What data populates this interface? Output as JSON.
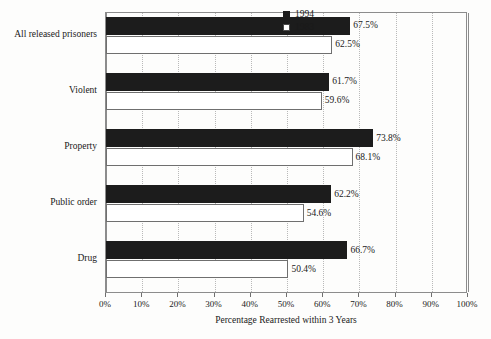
{
  "chart_data": {
    "type": "bar",
    "orientation": "horizontal",
    "title": "",
    "xlabel": "Percentage Rearrested within 3 Years",
    "ylabel": "",
    "xlim": [
      0,
      100
    ],
    "xticks": [
      "0%",
      "10%",
      "20%",
      "30%",
      "40%",
      "50%",
      "60%",
      "70%",
      "80%",
      "90%",
      "100%"
    ],
    "xtick_values": [
      0,
      10,
      20,
      30,
      40,
      50,
      60,
      70,
      80,
      90,
      100
    ],
    "grid": "vertical-dotted",
    "legend_position": "top-right",
    "categories": [
      "All released prisoners",
      "Violent",
      "Property",
      "Public order",
      "Drug"
    ],
    "series": [
      {
        "name": "1994",
        "color": "#1c1c1c",
        "fill": "solid",
        "values": [
          67.5,
          61.7,
          73.8,
          62.2,
          66.7
        ],
        "labels": [
          "67.5%",
          "61.7%",
          "73.8%",
          "62.2%",
          "66.7%"
        ]
      },
      {
        "name": "1983",
        "color": "#ffffff",
        "fill": "open",
        "values": [
          62.5,
          59.6,
          68.1,
          54.6,
          50.4
        ],
        "labels": [
          "62.5%",
          "59.6%",
          "68.1%",
          "54.6%",
          "50.4%"
        ]
      }
    ]
  },
  "legend": {
    "entries": [
      {
        "label": "1994",
        "swatch": "filled-square-icon"
      },
      {
        "label": "1983",
        "swatch": "open-square-icon"
      }
    ]
  },
  "colors": {
    "series_1994": "#1c1c1c",
    "series_1983": "#ffffff",
    "axis": "#8c8c8c",
    "gridline": "#b9b9b9",
    "text": "#1a1a1a",
    "background": "#fdfdfc"
  }
}
